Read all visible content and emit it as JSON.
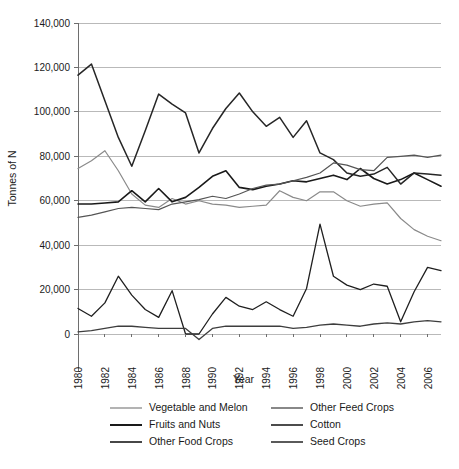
{
  "chart_data": {
    "type": "line",
    "title": "",
    "xlabel": "Year",
    "ylabel": "Tonnes of N",
    "grid": true,
    "legend_position": "bottom",
    "xlim": [
      1980,
      2007
    ],
    "ylim": [
      0,
      140000
    ],
    "yticks": [
      0,
      20000,
      40000,
      60000,
      80000,
      100000,
      120000,
      140000
    ],
    "ytick_labels": [
      "0",
      "20,000",
      "40,000",
      "60,000",
      "80,000",
      "100,000",
      "120,000",
      "140,000"
    ],
    "xticks": [
      1980,
      1982,
      1984,
      1986,
      1988,
      1990,
      1992,
      1994,
      1996,
      1998,
      2000,
      2002,
      2004,
      2006
    ],
    "xtick_labels": [
      "1980",
      "1982",
      "1984",
      "1986",
      "1988",
      "1990",
      "1992",
      "1994",
      "1996",
      "1998",
      "2000",
      "2002",
      "2004",
      "2006"
    ],
    "x": [
      1980,
      1981,
      1982,
      1983,
      1984,
      1985,
      1986,
      1987,
      1988,
      1989,
      1990,
      1991,
      1992,
      1993,
      1994,
      1995,
      1996,
      1997,
      1998,
      1999,
      2000,
      2001,
      2002,
      2003,
      2004,
      2005,
      2006,
      2007
    ],
    "series": [
      {
        "name": "Vegetable and Melon",
        "color": "#8a8a8a",
        "width": 1.2,
        "values": [
          74500,
          78000,
          82500,
          73500,
          63000,
          58000,
          57000,
          61000,
          58500,
          60000,
          58500,
          58000,
          57000,
          57500,
          58000,
          64500,
          61500,
          60000,
          64000,
          64000,
          60000,
          57500,
          58500,
          59000,
          52000,
          47000,
          44000,
          42000
        ]
      },
      {
        "name": "Fruits and Nuts",
        "color": "#1a1a1a",
        "width": 1.6,
        "values": [
          58500,
          58500,
          59000,
          59500,
          64500,
          59500,
          65500,
          59500,
          61500,
          66000,
          71000,
          73500,
          66000,
          65000,
          66500,
          67500,
          69000,
          68500,
          70000,
          71500,
          69500,
          74500,
          70000,
          67500,
          69500,
          72500,
          69500,
          66500
        ]
      },
      {
        "name": "Other Food Crops",
        "color": "#262626",
        "width": 1.5,
        "values": [
          116500,
          121500,
          105000,
          88500,
          75500,
          91500,
          108000,
          103500,
          99500,
          81500,
          92500,
          101500,
          108500,
          100000,
          93500,
          97500,
          88500,
          96000,
          81500,
          78500,
          72500,
          71000,
          72000,
          75000,
          67500,
          72500,
          72000,
          71500
        ]
      },
      {
        "name": "Other Feed Crops",
        "color": "#555555",
        "width": 1.2,
        "values": [
          52500,
          53500,
          55000,
          56500,
          57000,
          56500,
          56000,
          58500,
          59500,
          60500,
          62000,
          61000,
          63000,
          65500,
          67000,
          67500,
          69000,
          70500,
          72500,
          77000,
          76000,
          74000,
          73500,
          79500,
          80000,
          80500,
          79500,
          80500
        ]
      },
      {
        "name": "Cotton",
        "color": "#1f1f1f",
        "width": 1.3,
        "values": [
          11500,
          8000,
          14000,
          26000,
          17500,
          11000,
          7500,
          19500,
          0,
          0,
          9000,
          16500,
          12500,
          11000,
          14500,
          11000,
          8000,
          20500,
          49500,
          26000,
          22000,
          20000,
          22500,
          21500,
          5500,
          19000,
          30000,
          28500
        ]
      },
      {
        "name": "Seed Crops",
        "color": "#3d3d3d",
        "width": 1.3,
        "values": [
          1000,
          1500,
          2500,
          3500,
          3500,
          3000,
          2500,
          2500,
          2500,
          -2500,
          2500,
          3500,
          3500,
          3500,
          3500,
          3500,
          2500,
          3000,
          4000,
          4500,
          4000,
          3500,
          4500,
          5000,
          4500,
          5500,
          6000,
          5500
        ]
      }
    ]
  },
  "legend": {
    "entries": [
      {
        "label": "Vegetable and Melon",
        "color": "#8a8a8a",
        "width": 1.3
      },
      {
        "label": "Other Feed Crops",
        "color": "#555555",
        "width": 1.4
      },
      {
        "label": "Fruits and Nuts",
        "color": "#1a1a1a",
        "width": 2.0
      },
      {
        "label": "Cotton",
        "color": "#1f1f1f",
        "width": 1.6
      },
      {
        "label": "Other Food Crops",
        "color": "#262626",
        "width": 1.7
      },
      {
        "label": "Seed Crops",
        "color": "#3d3d3d",
        "width": 1.7
      }
    ]
  }
}
